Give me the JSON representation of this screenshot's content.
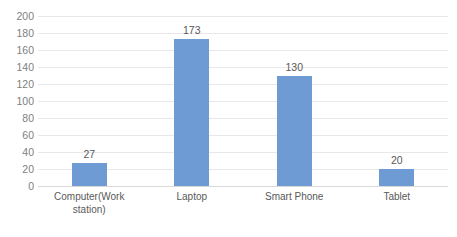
{
  "chart_data": {
    "type": "bar",
    "title": "",
    "subtitle": "",
    "xlabel": "",
    "ylabel": "",
    "ylim": [
      0,
      200
    ],
    "ytick_step": 20,
    "yticks": [
      200,
      180,
      160,
      140,
      120,
      100,
      80,
      60,
      40,
      20,
      0
    ],
    "categories": [
      "Computer(Work station)",
      "Laptop",
      "Smart Phone",
      "Tablet"
    ],
    "category_lines": [
      [
        "Computer(Work",
        "station)"
      ],
      [
        "Laptop"
      ],
      [
        "Smart Phone"
      ],
      [
        "Tablet"
      ]
    ],
    "values": [
      27,
      173,
      130,
      20
    ],
    "data_labels": [
      "27",
      "173",
      "130",
      "20"
    ],
    "grid": true,
    "grid_axis": "y",
    "legend": false,
    "legend_position": "none",
    "colors": {
      "bar": "#6e9bd4",
      "gridline": "#e8e8e8",
      "axis_line": "#d9d9d9",
      "tick_label": "#808080",
      "category_label": "#595959",
      "data_label": "#595959",
      "background": "#ffffff"
    }
  }
}
